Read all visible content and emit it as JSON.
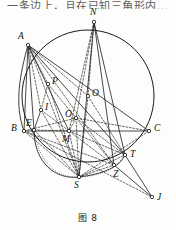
{
  "figure": {
    "caption": "图 8",
    "top_cut_text": "一条边上，且在已知三角形内..."
  },
  "geometry": {
    "circle": {
      "cx": 88,
      "cy": 96,
      "r": 66,
      "label": "circumcircle"
    },
    "points": [
      {
        "id": "A",
        "label": "A",
        "x": 28,
        "y": 45,
        "lx": 18,
        "ly": 32
      },
      {
        "id": "N",
        "label": "N",
        "x": 94,
        "y": 22,
        "lx": 90,
        "ly": 8
      },
      {
        "id": "B",
        "label": "B",
        "x": 24,
        "y": 131,
        "lx": 11,
        "ly": 124
      },
      {
        "id": "C",
        "label": "C",
        "x": 149,
        "y": 131,
        "lx": 154,
        "ly": 124
      },
      {
        "id": "E",
        "label": "E",
        "x": 34,
        "y": 130,
        "lx": 26,
        "ly": 119
      },
      {
        "id": "M",
        "label": "M",
        "x": 69,
        "y": 131,
        "lx": 62,
        "ly": 135
      },
      {
        "id": "P",
        "label": "P",
        "x": 48,
        "y": 84,
        "lx": 52,
        "ly": 77
      },
      {
        "id": "I",
        "label": "I",
        "x": 41,
        "y": 110,
        "lx": 45,
        "ly": 103
      },
      {
        "id": "O",
        "label": "O",
        "x": 88,
        "y": 96,
        "lx": 92,
        "ly": 89
      },
      {
        "id": "O1",
        "label": "O",
        "sub": "1",
        "x": 76,
        "y": 118,
        "lx": 65,
        "ly": 110
      },
      {
        "id": "S",
        "label": "S",
        "x": 79,
        "y": 177,
        "lx": 74,
        "ly": 181
      },
      {
        "id": "Z",
        "label": "Z",
        "x": 114,
        "y": 165,
        "lx": 113,
        "ly": 170
      },
      {
        "id": "T",
        "label": "T",
        "x": 125,
        "y": 155,
        "lx": 130,
        "ly": 150
      },
      {
        "id": "J",
        "label": "J",
        "x": 152,
        "y": 197,
        "lx": 157,
        "ly": 193
      }
    ],
    "solid_segments": [
      [
        "A",
        "B"
      ],
      [
        "A",
        "C"
      ],
      [
        "B",
        "C"
      ],
      [
        "A",
        "E"
      ],
      [
        "A",
        "M"
      ],
      [
        "N",
        "S"
      ],
      [
        "N",
        "T"
      ],
      [
        "T",
        "J"
      ],
      [
        "Z",
        "J"
      ],
      [
        "E",
        "I"
      ],
      [
        "N",
        "Z"
      ],
      [
        "A",
        "T"
      ]
    ],
    "dashed_segments": [
      [
        "N",
        "O"
      ],
      [
        "N",
        "O1"
      ],
      [
        "N",
        "M"
      ],
      [
        "A",
        "P"
      ],
      [
        "A",
        "I"
      ],
      [
        "A",
        "S"
      ],
      [
        "A",
        "Z"
      ],
      [
        "O",
        "S"
      ],
      [
        "O1",
        "S"
      ],
      [
        "O1",
        "M"
      ],
      [
        "O1",
        "Z"
      ],
      [
        "O1",
        "T"
      ],
      [
        "B",
        "S"
      ],
      [
        "B",
        "Z"
      ],
      [
        "B",
        "O1"
      ],
      [
        "B",
        "J"
      ],
      [
        "M",
        "T"
      ],
      [
        "M",
        "S"
      ],
      [
        "M",
        "Z"
      ],
      [
        "P",
        "I"
      ],
      [
        "P",
        "O1"
      ],
      [
        "I",
        "S"
      ],
      [
        "S",
        "Z"
      ],
      [
        "S",
        "T"
      ],
      [
        "E",
        "S"
      ],
      [
        "E",
        "M"
      ],
      [
        "C",
        "O1"
      ],
      [
        "C",
        "S"
      ],
      [
        "P",
        "S"
      ],
      [
        "A",
        "O"
      ],
      [
        "I",
        "M"
      ],
      [
        "O",
        "T"
      ]
    ],
    "arcs": [
      {
        "name": "small-circle-arc-BPS",
        "d": "M 24 131 C 14 104 20 74 28 45",
        "style": "solid"
      },
      {
        "name": "incircle-arc-ESZ",
        "d": "M 34 130 C 34 163 56 180 79 177 C 103 174 120 167 125 155",
        "style": "solid"
      },
      {
        "name": "arc-S-dotted",
        "d": "M 34 131 C 40 165 58 178 79 177 C 100 176 115 170 124 156",
        "style": "dotted"
      }
    ],
    "style": {
      "stroke": "#1a1a1a",
      "dash_pattern": "2,1.6",
      "dot_pattern": "0.8,1.4",
      "line_width": 0.8,
      "circle_width": 1.0,
      "point_radius": 1.7
    }
  }
}
